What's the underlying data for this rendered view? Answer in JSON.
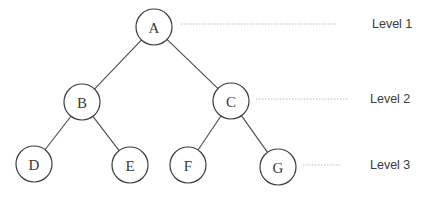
{
  "diagram": {
    "type": "binary-tree",
    "node_radius": 18,
    "nodes": [
      {
        "id": "A",
        "label": "A",
        "x": 154,
        "y": 27,
        "level": 1
      },
      {
        "id": "B",
        "label": "B",
        "x": 82,
        "y": 102,
        "level": 2
      },
      {
        "id": "C",
        "label": "C",
        "x": 231,
        "y": 101,
        "level": 2
      },
      {
        "id": "D",
        "label": "D",
        "x": 34,
        "y": 164,
        "level": 3
      },
      {
        "id": "E",
        "label": "E",
        "x": 130,
        "y": 165,
        "level": 3
      },
      {
        "id": "F",
        "label": "F",
        "x": 188,
        "y": 165,
        "level": 3
      },
      {
        "id": "G",
        "label": "G",
        "x": 278,
        "y": 167,
        "level": 3
      }
    ],
    "edges": [
      {
        "from": "A",
        "to": "B"
      },
      {
        "from": "A",
        "to": "C"
      },
      {
        "from": "B",
        "to": "D"
      },
      {
        "from": "B",
        "to": "E"
      },
      {
        "from": "C",
        "to": "F"
      },
      {
        "from": "C",
        "to": "G"
      }
    ],
    "levels": [
      {
        "label": "Level 1",
        "guide_x1": 181,
        "guide_x2": 337,
        "y": 24,
        "label_x": 372
      },
      {
        "label": "Level 2",
        "guide_x1": 256,
        "guide_x2": 349,
        "y": 99,
        "label_x": 370
      },
      {
        "label": "Level 3",
        "guide_x1": 303,
        "guide_x2": 340,
        "y": 165,
        "label_x": 370
      }
    ]
  }
}
